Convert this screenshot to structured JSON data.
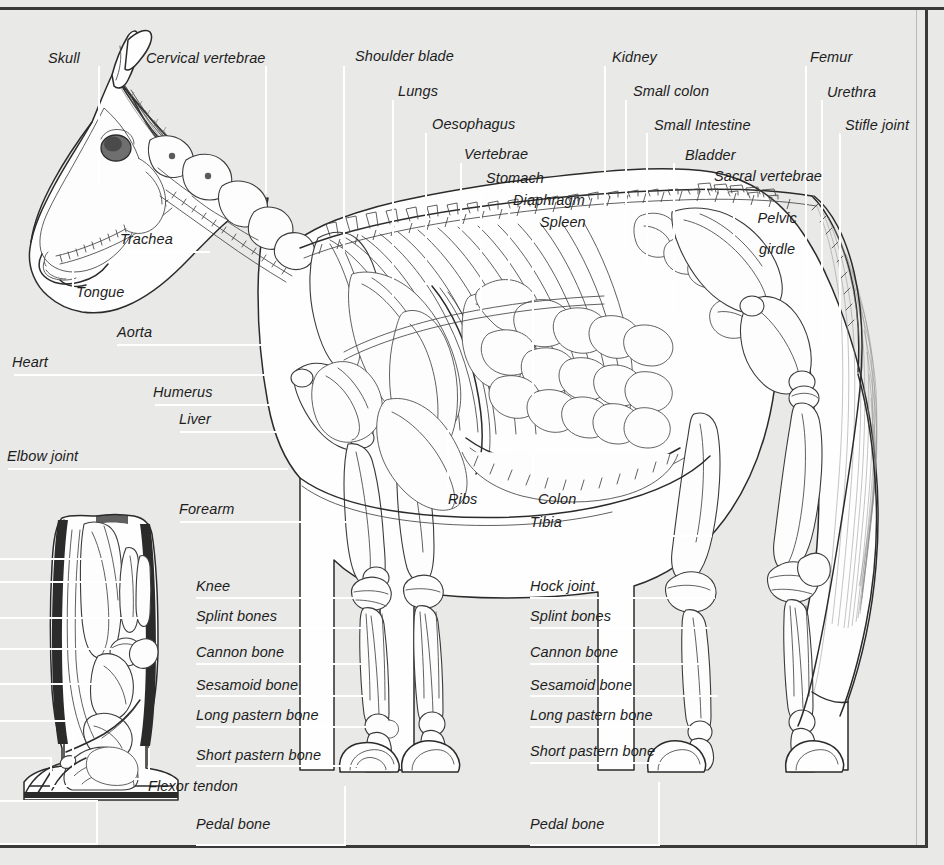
{
  "figure": {
    "background_color": "#e9e9e7",
    "frame_color": "#3a3a3a",
    "leader_color": "#ffffff",
    "ink_color": "#2b2b2b"
  },
  "labels": {
    "skull": "Skull",
    "cervical_vertebrae": "Cervical vertebrae",
    "shoulder_blade": "Shoulder blade",
    "lungs": "Lungs",
    "oesophagus": "Oesophagus",
    "vertebrae": "Vertebrae",
    "stomach": "Stomach",
    "diaphragm": "Diaphragm",
    "spleen": "Spleen",
    "kidney": "Kidney",
    "small_colon": "Small colon",
    "small_intestine": "Small Intestine",
    "bladder": "Bladder",
    "sacral_vertebrae": "Sacral vertebrae",
    "pelvic_girdle_l1": "Pelvic",
    "pelvic_girdle_l2": "girdle",
    "femur": "Femur",
    "urethra": "Urethra",
    "stifle_joint": "Stifle joint",
    "trachea": "Trachea",
    "tongue": "Tongue",
    "aorta": "Aorta",
    "heart": "Heart",
    "humerus": "Humerus",
    "liver": "Liver",
    "elbow_joint": "Elbow joint",
    "forearm": "Forearm",
    "ribs": "Ribs",
    "colon": "Colon",
    "tibia": "Tibia",
    "knee": "Knee",
    "splint_bones_front": "Splint bones",
    "cannon_bone_front": "Cannon bone",
    "sesamoid_bone_front": "Sesamoid bone",
    "long_pastern_bone_front": "Long pastern bone",
    "short_pastern_bone_front": "Short pastern bone",
    "flexor_tendon": "Flexor tendon",
    "pedal_bone_front": "Pedal bone",
    "hock_joint": "Hock joint",
    "splint_bones_hind": "Splint bones",
    "cannon_bone_hind": "Cannon bone",
    "sesamoid_bone_hind": "Sesamoid bone",
    "long_pastern_bone_hind": "Long pastern bone",
    "short_pastern_bone_hind": "Short pastern bone",
    "pedal_bone_hind": "Pedal bone"
  }
}
